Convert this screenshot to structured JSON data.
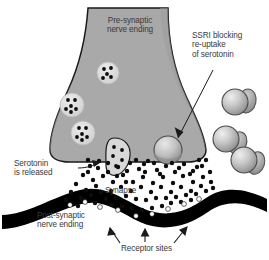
{
  "figure": {
    "type": "biological-diagram",
    "width": 269,
    "height": 260,
    "background_color": "#ffffff"
  },
  "labels": {
    "presynaptic": "Pre-synaptic\nnerve ending",
    "ssri": "SSRI blocking\nre-uptake\nof serotonin",
    "serotonin_released": "Serotonin\nis released",
    "synapse": "Synapse",
    "postsynaptic": "Post-synaptic\nnerve ending",
    "receptor_sites": "Receptor sites"
  },
  "colors": {
    "terminal_fill": "#a9a9a9",
    "terminal_outline": "#1a1a1a",
    "vesicle_fill": "#d9d9d9",
    "neurotransmitter": "#0d0d0d",
    "membrane": "#000000",
    "ssri_body": "#b5b5b5",
    "ssri_cap": "#8f8f8f",
    "text": "#3a3a3a",
    "leader_line": "#1a1a1a",
    "background": "#ffffff"
  },
  "elements": {
    "presynaptic_terminal": {
      "name": "Pre-synaptic nerve ending",
      "shape": "funnel widening downward",
      "fill": "#a9a9a9"
    },
    "vesicles": {
      "name": "Synaptic vesicles containing serotonin",
      "count": 4,
      "positions": [
        {
          "cx": 108,
          "cy": 73,
          "r": 11,
          "dots": 5
        },
        {
          "cx": 72,
          "cy": 105,
          "r": 12,
          "dots": 6
        },
        {
          "cx": 83,
          "cy": 133,
          "r": 12,
          "dots": 6
        },
        {
          "cx": 114,
          "cy": 153,
          "r": 13,
          "dots": 5
        }
      ],
      "fusing_vesicle": "bottom vesicle fusing with membrane releasing serotonin"
    },
    "ssri_molecules": {
      "name": "SSRI molecules",
      "count": 3,
      "positions": [
        {
          "cx": 238,
          "cy": 102,
          "r": 14
        },
        {
          "cx": 228,
          "cy": 139,
          "r": 14
        },
        {
          "cx": 246,
          "cy": 160,
          "r": 14
        }
      ]
    },
    "reuptake_transporter": {
      "name": "Serotonin re-uptake transporter blocked by SSRI",
      "cx": 168,
      "cy": 151,
      "r": 14
    },
    "serotonin_particles": {
      "name": "Serotonin molecules in the synaptic cleft",
      "approximate_count": 110,
      "radius": 2.2
    },
    "postsynaptic_membrane": {
      "name": "Post-synaptic nerve ending membrane",
      "shape": "thick black wavy band",
      "color": "#000000"
    },
    "receptor_arrows": {
      "name": "Arrows pointing to receptor sites",
      "count": 3,
      "directions": [
        "up-left",
        "up",
        "up-right"
      ]
    }
  },
  "leader_lines": {
    "ssri_to_transporter": {
      "from": [
        212,
        72
      ],
      "to": [
        178,
        137
      ]
    },
    "serotonin_to_cleft": {
      "from": [
        78,
        169
      ],
      "to": [
        100,
        165
      ]
    }
  }
}
